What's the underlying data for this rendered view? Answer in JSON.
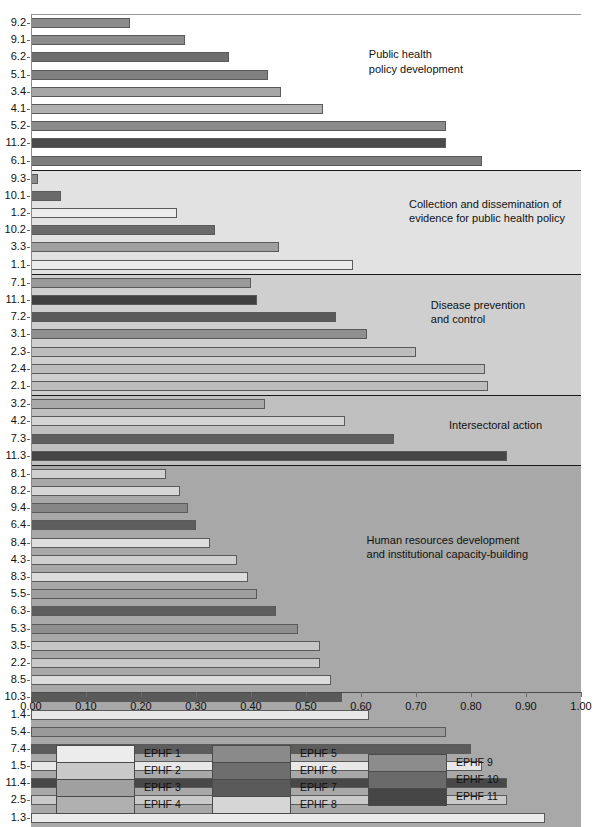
{
  "chart_data": {
    "type": "bar",
    "orientation": "horizontal",
    "title": "",
    "xlabel": "",
    "ylabel": "",
    "xlim": [
      0.0,
      1.0
    ],
    "xticks": [
      "0.00",
      "0.10",
      "0.20",
      "0.30",
      "0.40",
      "0.50",
      "0.60",
      "0.70",
      "0.80",
      "0.90",
      "1.00"
    ],
    "grid": false,
    "legend_position": "bottom",
    "sections": [
      {
        "label": "Public health\npolicy development",
        "background": "#ffffff",
        "label_right": 118,
        "label_top": 32,
        "bars": [
          {
            "category": "9.2",
            "value": 0.18,
            "series": "EPHF 9",
            "color": "#8c8c8c"
          },
          {
            "category": "9.1",
            "value": 0.28,
            "series": "EPHF 9",
            "color": "#8c8c8c"
          },
          {
            "category": "6.2",
            "value": 0.36,
            "series": "EPHF 6",
            "color": "#6e6e6e"
          },
          {
            "category": "5.1",
            "value": 0.43,
            "series": "EPHF 5",
            "color": "#808080"
          },
          {
            "category": "3.4",
            "value": 0.455,
            "series": "EPHF 3",
            "color": "#a6a6a6"
          },
          {
            "category": "4.1",
            "value": 0.53,
            "series": "EPHF 4",
            "color": "#b0b0b0"
          },
          {
            "category": "5.2",
            "value": 0.755,
            "series": "EPHF 5",
            "color": "#8a8a8a"
          },
          {
            "category": "11.2",
            "value": 0.755,
            "series": "EPHF 11",
            "color": "#4a4a4a"
          },
          {
            "category": "6.1",
            "value": 0.82,
            "series": "EPHF 6",
            "color": "#7d7d7d"
          }
        ]
      },
      {
        "label": "Collection and dissemination of\nevidence for public health policy",
        "background": "#e2e2e2",
        "label_right": 16,
        "label_top": 26,
        "bars": [
          {
            "category": "9.3",
            "value": 0.012,
            "series": "EPHF 9",
            "color": "#8c8c8c"
          },
          {
            "category": "10.1",
            "value": 0.055,
            "series": "EPHF 10",
            "color": "#6a6a6a"
          },
          {
            "category": "1.2",
            "value": 0.265,
            "series": "EPHF 1",
            "color": "#ececec"
          },
          {
            "category": "10.2",
            "value": 0.335,
            "series": "EPHF 10",
            "color": "#6a6a6a"
          },
          {
            "category": "3.3",
            "value": 0.45,
            "series": "EPHF 3",
            "color": "#a0a0a0"
          },
          {
            "category": "1.1",
            "value": 0.585,
            "series": "EPHF 1",
            "color": "#ececec"
          }
        ]
      },
      {
        "label": "Disease prevention\nand control",
        "background": "#cfcfcf",
        "label_right": 56,
        "label_top": 23,
        "bars": [
          {
            "category": "7.1",
            "value": 0.4,
            "series": "EPHF 7",
            "color": "#9a9a9a"
          },
          {
            "category": "11.1",
            "value": 0.41,
            "series": "EPHF 11",
            "color": "#3f3f3f"
          },
          {
            "category": "7.2",
            "value": 0.555,
            "series": "EPHF 7",
            "color": "#5a5a5a"
          },
          {
            "category": "3.1",
            "value": 0.61,
            "series": "EPHF 3",
            "color": "#909090"
          },
          {
            "category": "2.3",
            "value": 0.7,
            "series": "EPHF 2",
            "color": "#bdbdbd"
          },
          {
            "category": "2.4",
            "value": 0.825,
            "series": "EPHF 2",
            "color": "#bdbdbd"
          },
          {
            "category": "2.1",
            "value": 0.83,
            "series": "EPHF 2",
            "color": "#bdbdbd"
          }
        ]
      },
      {
        "label": "Intersectoral action",
        "background": "#c0c0c0",
        "label_right": 39,
        "label_top": 22,
        "bars": [
          {
            "category": "3.2",
            "value": 0.425,
            "series": "EPHF 3",
            "color": "#a8a8a8"
          },
          {
            "category": "4.2",
            "value": 0.57,
            "series": "EPHF 4",
            "color": "#d4d4d4"
          },
          {
            "category": "7.3",
            "value": 0.66,
            "series": "EPHF 7",
            "color": "#5e5e5e"
          },
          {
            "category": "11.3",
            "value": 0.865,
            "series": "EPHF 11",
            "color": "#464646"
          }
        ]
      },
      {
        "label": "Human resources development\nand institutional capacity-building",
        "background": "#a8a8a8",
        "label_right": 53,
        "label_top": 67,
        "bars": [
          {
            "category": "8.1",
            "value": 0.245,
            "series": "EPHF 8",
            "color": "#d0d0d0"
          },
          {
            "category": "8.2",
            "value": 0.27,
            "series": "EPHF 8",
            "color": "#d6d6d6"
          },
          {
            "category": "9.4",
            "value": 0.285,
            "series": "EPHF 9",
            "color": "#868686"
          },
          {
            "category": "6.4",
            "value": 0.3,
            "series": "EPHF 6",
            "color": "#5d5d5d"
          },
          {
            "category": "8.4",
            "value": 0.325,
            "series": "EPHF 8",
            "color": "#dedede"
          },
          {
            "category": "4.3",
            "value": 0.375,
            "series": "EPHF 4",
            "color": "#cfcfcf"
          },
          {
            "category": "8.3",
            "value": 0.395,
            "series": "EPHF 8",
            "color": "#dcdcdc"
          },
          {
            "category": "5.5",
            "value": 0.41,
            "series": "EPHF 5",
            "color": "#9e9e9e"
          },
          {
            "category": "6.3",
            "value": 0.445,
            "series": "EPHF 6",
            "color": "#5d5d5d"
          },
          {
            "category": "5.3",
            "value": 0.485,
            "series": "EPHF 5",
            "color": "#8e8e8e"
          },
          {
            "category": "3.5",
            "value": 0.525,
            "series": "EPHF 3",
            "color": "#c6c6c6"
          },
          {
            "category": "2.2",
            "value": 0.525,
            "series": "EPHF 2",
            "color": "#c9c9c9"
          },
          {
            "category": "8.5",
            "value": 0.545,
            "series": "EPHF 8",
            "color": "#dcdcdc"
          },
          {
            "category": "10.3",
            "value": 0.565,
            "series": "EPHF 10",
            "color": "#5a5a5a"
          },
          {
            "category": "1.4",
            "value": 0.615,
            "series": "EPHF 1",
            "color": "#e8e8e8"
          },
          {
            "category": "5.4",
            "value": 0.755,
            "series": "EPHF 5",
            "color": "#9a9a9a"
          },
          {
            "category": "7.4",
            "value": 0.8,
            "series": "EPHF 7",
            "color": "#5c5c5c"
          },
          {
            "category": "1.5",
            "value": 0.82,
            "series": "EPHF 1",
            "color": "#e8e8e8"
          },
          {
            "category": "11.4",
            "value": 0.865,
            "series": "EPHF 11",
            "color": "#484848"
          },
          {
            "category": "2.5",
            "value": 0.865,
            "series": "EPHF 2",
            "color": "#cacaca"
          },
          {
            "category": "1.3",
            "value": 0.935,
            "series": "EPHF 1",
            "color": "#ececec"
          }
        ]
      }
    ],
    "legend_groups": [
      {
        "left": 56,
        "entries": [
          {
            "label": "EPHF 1",
            "color": "#ececec"
          },
          {
            "label": "EPHF 2",
            "color": "#c9c9c9"
          },
          {
            "label": "EPHF 3",
            "color": "#a0a0a0"
          },
          {
            "label": "EPHF 4",
            "color": "#b0b0b0"
          }
        ]
      },
      {
        "left": 212,
        "entries": [
          {
            "label": "EPHF 5",
            "color": "#8a8a8a"
          },
          {
            "label": "EPHF 6",
            "color": "#6e6e6e"
          },
          {
            "label": "EPHF 7",
            "color": "#5a5a5a"
          },
          {
            "label": "EPHF 8",
            "color": "#d6d6d6"
          }
        ]
      },
      {
        "left": 368,
        "entries": [
          {
            "label": "EPHF 9",
            "color": "#8c8c8c"
          },
          {
            "label": "EPHF 10",
            "color": "#6a6a6a"
          },
          {
            "label": "EPHF 11",
            "color": "#464646"
          }
        ]
      }
    ]
  }
}
